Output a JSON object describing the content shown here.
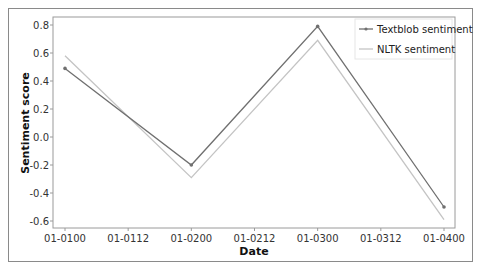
{
  "chart_data": {
    "type": "line",
    "title": "",
    "xlabel": "Date",
    "ylabel": "Sentiment score",
    "x": [
      "01-01 00",
      "01-02 00",
      "01-03 00",
      "01-04 00"
    ],
    "x_tick_labels": [
      "01-0100",
      "01-0112",
      "01-0200",
      "01-0212",
      "01-0300",
      "01-0312",
      "01-0400"
    ],
    "y_tick_labels": [
      "0.8",
      "0.6",
      "0.4",
      "0.2",
      "0.0",
      "-0.2",
      "-0.4",
      "-0.6"
    ],
    "ylim": [
      -0.65,
      0.85
    ],
    "grid": false,
    "legend_position": "upper right",
    "series": [
      {
        "name": "Textblob sentiment",
        "values": [
          0.49,
          -0.2,
          0.79,
          -0.5
        ],
        "color": "#707070",
        "marker": "dot"
      },
      {
        "name": "NLTK sentiment",
        "values": [
          0.58,
          -0.29,
          0.69,
          -0.59
        ],
        "color": "#c4c4c4",
        "marker": "none"
      }
    ]
  },
  "legend": {
    "items": [
      {
        "label": "Textblob sentiment"
      },
      {
        "label": "NLTK sentiment"
      }
    ]
  },
  "axes": {
    "xlabel": "Date",
    "ylabel": "Sentiment score"
  }
}
